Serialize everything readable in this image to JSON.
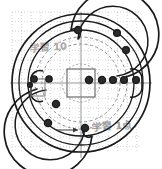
{
  "figure": {
    "title": "",
    "background_color": "#ffffff",
    "ink_color": "#1a1a1a",
    "faint_ink_color": "#8d8d8d",
    "grid_color": "#b9b9b9",
    "width": 162,
    "height": 169
  },
  "grid": {
    "visible": true,
    "style": "dotted",
    "spacing_px": 9.6,
    "origin_x": 12,
    "origin_y": 12,
    "extent_x": 140,
    "extent_y": 152,
    "color": "#b8b8b8"
  },
  "axes": {
    "center_x": 81,
    "center_y": 83,
    "vertical_line": {
      "x": 81,
      "y1": 12,
      "y2": 158,
      "label": "center-vertical-axis"
    },
    "horizontal_line": {
      "y": 83,
      "x1": 10,
      "x2": 152,
      "label": "center-horizontal-axis"
    }
  },
  "chart_data": {
    "type": "diagram",
    "circles": [
      {
        "name": "outer-rim",
        "cx": 81,
        "cy": 83,
        "r": 69,
        "stroke": "#1a1a1a",
        "width": 1.6,
        "dash": "none"
      },
      {
        "name": "outer-rim-inner",
        "cx": 81,
        "cy": 83,
        "r": 62,
        "stroke": "#1a1a1a",
        "width": 1.3,
        "dash": "none"
      },
      {
        "name": "mid-ring-outer",
        "cx": 81,
        "cy": 83,
        "r": 53,
        "stroke": "#1a1a1a",
        "width": 1.3,
        "dash": "none"
      },
      {
        "name": "mid-ring-dashed",
        "cx": 81,
        "cy": 83,
        "r": 46,
        "stroke": "#8d8d8d",
        "width": 1.0,
        "dash": "3 2"
      },
      {
        "name": "inner-bolt-circle",
        "cx": 81,
        "cy": 83,
        "r": 39,
        "stroke": "#8d8d8d",
        "width": 1.0,
        "dash": "3 2"
      },
      {
        "name": "hub-circle",
        "cx": 81,
        "cy": 83,
        "r": 19,
        "stroke": "#8d8d8d",
        "width": 0.9,
        "dash": "2 2"
      }
    ],
    "center_square": {
      "name": "center-square",
      "x": 67,
      "y": 69,
      "size": 28,
      "stroke": "#6b6b6b",
      "width": 1.2
    },
    "markers": [
      {
        "id": "m01",
        "cx": 34,
        "cy": 79,
        "r": 3.2,
        "filled": true
      },
      {
        "id": "m02",
        "cx": 49,
        "cy": 79,
        "r": 3.2,
        "filled": true
      },
      {
        "id": "m03",
        "cx": 89,
        "cy": 80,
        "r": 3.6,
        "filled": true
      },
      {
        "id": "m04",
        "cx": 102,
        "cy": 80,
        "r": 3.6,
        "filled": true
      },
      {
        "id": "m05",
        "cx": 113,
        "cy": 80,
        "r": 3.4,
        "filled": true
      },
      {
        "id": "m06",
        "cx": 124,
        "cy": 80,
        "r": 3.4,
        "filled": true
      },
      {
        "id": "m07",
        "cx": 136,
        "cy": 80,
        "r": 3.4,
        "filled": true
      },
      {
        "id": "m08",
        "cx": 78,
        "cy": 30,
        "r": 3.6,
        "filled": true
      },
      {
        "id": "m09",
        "cx": 117,
        "cy": 33,
        "r": 3.4,
        "filled": true
      },
      {
        "id": "m10",
        "cx": 126,
        "cy": 50,
        "r": 3.4,
        "filled": true
      },
      {
        "id": "m11",
        "cx": 56,
        "cy": 104,
        "r": 3.6,
        "filled": true
      },
      {
        "id": "m12",
        "cx": 48,
        "cy": 123,
        "r": 3.6,
        "filled": true
      },
      {
        "id": "m13",
        "cx": 85,
        "cy": 128,
        "r": 3.6,
        "filled": true
      },
      {
        "id": "m14",
        "cx": 30,
        "cy": 85,
        "r": 2.4,
        "filled": true
      }
    ],
    "spiral_arcs": [
      {
        "name": "upper-spiral-arc",
        "description": "C-shaped arc opening downward in upper half"
      },
      {
        "name": "lower-spiral-arc",
        "description": "C-shaped arc opening upward in lower half"
      },
      {
        "name": "left-loop",
        "description": "small rounded loop at left mid-height"
      },
      {
        "name": "right-loop",
        "description": "small rounded loop at right mid-height"
      }
    ],
    "annotations": [
      {
        "id": "anno-top-left",
        "text": "学習 10",
        "x": 30,
        "y": 50,
        "rotation": -4,
        "color": "#9a9a9a",
        "size": 9
      },
      {
        "id": "anno-bottom-right",
        "text": "学習 1点",
        "x": 92,
        "y": 129,
        "rotation": -4,
        "color": "#8a8a8a",
        "size": 9
      }
    ],
    "arrows": [
      {
        "id": "arrow-bottom",
        "x1": 56,
        "y1": 130,
        "x2": 80,
        "y2": 130,
        "direction": "right"
      }
    ]
  },
  "legend": {
    "visible": false,
    "entries": []
  }
}
